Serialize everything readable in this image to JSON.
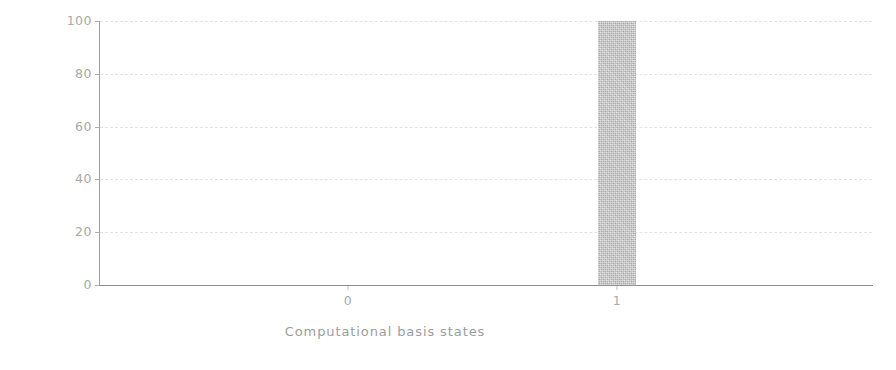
{
  "chart_data": {
    "type": "bar",
    "title": "",
    "subtitle": "",
    "xlabel": "Computational basis states",
    "ylabel": "Probability (% of 1024 shots)",
    "categories": [
      "0",
      "1"
    ],
    "values": [
      0,
      100
    ],
    "series": [
      {
        "name": "Probability",
        "values": [
          0,
          100
        ]
      }
    ],
    "xtick_labels": [
      "0",
      "1"
    ],
    "ytick_labels": [
      "0",
      "20",
      "40",
      "60",
      "80",
      "100"
    ],
    "ytick_values": [
      0,
      20,
      40,
      60,
      80,
      100
    ],
    "ylim": [
      0,
      100
    ],
    "grid": "horizontal-dashed",
    "legend": "none",
    "annotations": [],
    "bar_color": "#bdbdbd",
    "axis_color": "#9e9e9e",
    "text_color": "#9d9d9d",
    "grid_color": "#e3e3e3",
    "background_color": "#ffffff",
    "shots": 1024
  },
  "figure": {
    "width": 896,
    "height": 370
  }
}
